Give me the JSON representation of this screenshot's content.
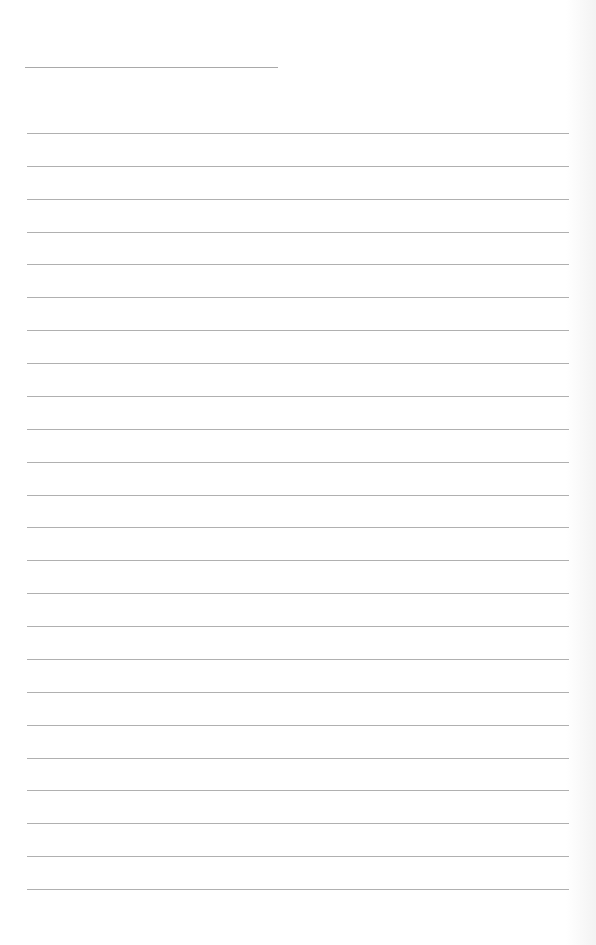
{
  "page": {
    "type": "lined-paper",
    "background_color": "#ffffff",
    "line_color": "#b0b0b0",
    "header_line": {
      "label": "",
      "x": 25,
      "y": 67,
      "width": 253
    },
    "ruled_lines": {
      "count": 24,
      "first_y": 133,
      "spacing": 32.87,
      "x": 27,
      "width": 542
    }
  }
}
